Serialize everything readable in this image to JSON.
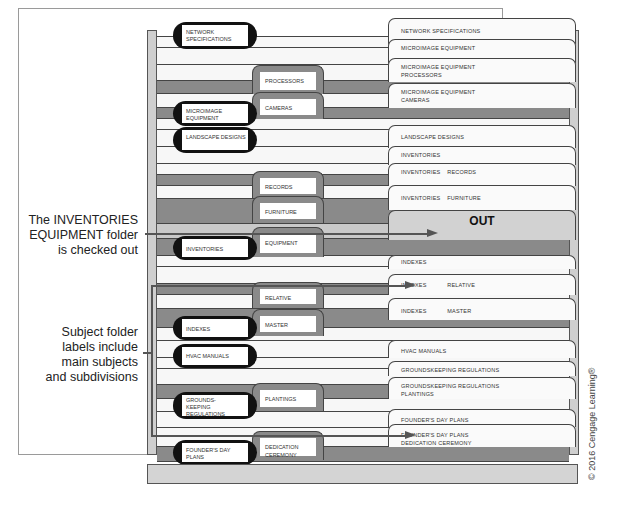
{
  "callouts": {
    "checked_out": [
      "The INVENTORIES",
      "EQUIPMENT folder",
      "is checked out"
    ],
    "subject_labels": [
      "Subject folder",
      "labels include",
      "main subjects",
      "and subdivisions"
    ]
  },
  "out_guide": {
    "label": "OUT"
  },
  "primary_guides": [
    {
      "label": "NETWORK SPECIFICATIONS"
    },
    {
      "label": "MICROIMAGE EQUIPMENT"
    },
    {
      "label": "LANDSCAPE DESIGNS"
    },
    {
      "label": "INVENTORIES"
    },
    {
      "label": "INDEXES"
    },
    {
      "label": "HVAC MANUALS"
    },
    {
      "label": "GROUNDS-KEEPING REGULATIONS"
    },
    {
      "label": "FOUNDER'S DAY PLANS"
    }
  ],
  "secondary_guides": [
    {
      "label": "PROCESSORS"
    },
    {
      "label": "CAMERAS"
    },
    {
      "label": "RECORDS"
    },
    {
      "label": "FURNITURE"
    },
    {
      "label": "EQUIPMENT"
    },
    {
      "label": "RELATIVE"
    },
    {
      "label": "MASTER"
    },
    {
      "label": "PLANTINGS"
    },
    {
      "label": "DEDICATION CEREMONY"
    }
  ],
  "folders": [
    {
      "line1": "NETWORK SPECIFICATIONS",
      "line2": ""
    },
    {
      "line1": "MICROIMAGE EQUIPMENT",
      "line2": ""
    },
    {
      "line1": "MICROIMAGE EQUIPMENT",
      "line2": "PROCESSORS"
    },
    {
      "line1": "MICROIMAGE EQUIPMENT",
      "line2": "CAMERAS"
    },
    {
      "line1": "LANDSCAPE DESIGNS",
      "line2": ""
    },
    {
      "line1": "INVENTORIES",
      "line2": ""
    },
    {
      "line1": "INVENTORIES    RECORDS",
      "line2": ""
    },
    {
      "line1": "INVENTORIES    FURNITURE",
      "line2": ""
    },
    {
      "line1": "INDEXES",
      "line2": ""
    },
    {
      "line1": "INDEXES            RELATIVE",
      "line2": ""
    },
    {
      "line1": "INDEXES            MASTER",
      "line2": ""
    },
    {
      "line1": "HVAC MANUALS",
      "line2": ""
    },
    {
      "line1": "GROUNDSKEEPING REGULATIONS",
      "line2": ""
    },
    {
      "line1": "GROUNDSKEEPING REGULATIONS",
      "line2": "PLANTINGS"
    },
    {
      "line1": "FOUNDER'S DAY PLANS",
      "line2": ""
    },
    {
      "line1": "FOUNDER'S DAY PLANS",
      "line2": "DEDICATION CEREMONY"
    }
  ],
  "credit": "© 2016 Cengage Learning®"
}
